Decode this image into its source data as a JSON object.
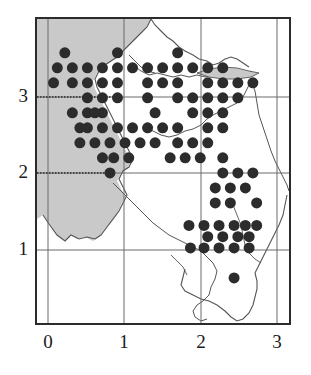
{
  "figure": {
    "kind": "distribution-grid-map",
    "width": 311,
    "height": 375
  },
  "colors": {
    "background": "#ffffff",
    "frame": "#2b2b2b",
    "gridline": "#6a6a6a",
    "dot": "#2c2c2c",
    "sea_shading": "#c9c9c9",
    "coastline": "#555555",
    "label": "#1a1a1a"
  },
  "axes": {
    "x": {
      "ticks": [
        {
          "label": "0",
          "value": 0,
          "px": 48
        },
        {
          "label": "1",
          "value": 1,
          "px": 124
        },
        {
          "label": "2",
          "value": 2,
          "px": 201
        },
        {
          "label": "3",
          "value": 3,
          "px": 277
        }
      ],
      "range": [
        -0.17,
        3.18
      ]
    },
    "y": {
      "ticks": [
        {
          "label": "1",
          "value": 1,
          "px": 249
        },
        {
          "label": "2",
          "value": 2,
          "px": 172
        },
        {
          "label": "3",
          "value": 3,
          "px": 96
        }
      ],
      "range": [
        0.0,
        4.05
      ]
    },
    "grid_spacing_px": 76,
    "dotted_gridlines": [
      "y=3 left of x=1",
      "y=2 left of x=0.8"
    ]
  },
  "chart_data": {
    "type": "scatter",
    "title": "",
    "xlabel": "",
    "ylabel": "",
    "xlim": [
      -0.17,
      3.18
    ],
    "ylim": [
      0.0,
      4.05
    ],
    "grid": true,
    "legend": null,
    "marker": "filled-circle",
    "marker_size_px": 11,
    "cell_size": 0.2,
    "points": [
      [
        0.2,
        3.6
      ],
      [
        0.9,
        3.6
      ],
      [
        1.7,
        3.6
      ],
      [
        0.1,
        3.4
      ],
      [
        0.3,
        3.4
      ],
      [
        0.5,
        3.4
      ],
      [
        0.7,
        3.4
      ],
      [
        0.9,
        3.4
      ],
      [
        1.1,
        3.4
      ],
      [
        1.3,
        3.4
      ],
      [
        1.5,
        3.4
      ],
      [
        1.7,
        3.4
      ],
      [
        1.9,
        3.4
      ],
      [
        2.1,
        3.4
      ],
      [
        2.3,
        3.4
      ],
      [
        0.05,
        3.2
      ],
      [
        0.3,
        3.2
      ],
      [
        0.5,
        3.2
      ],
      [
        0.7,
        3.2
      ],
      [
        0.9,
        3.2
      ],
      [
        1.3,
        3.2
      ],
      [
        1.5,
        3.2
      ],
      [
        1.7,
        3.2
      ],
      [
        2.1,
        3.2
      ],
      [
        2.3,
        3.2
      ],
      [
        2.5,
        3.2
      ],
      [
        2.7,
        3.2
      ],
      [
        0.5,
        3.0
      ],
      [
        0.7,
        3.0
      ],
      [
        0.9,
        3.0
      ],
      [
        1.3,
        3.0
      ],
      [
        1.7,
        3.0
      ],
      [
        1.9,
        3.0
      ],
      [
        2.1,
        3.0
      ],
      [
        2.3,
        3.0
      ],
      [
        2.5,
        3.0
      ],
      [
        0.3,
        2.8
      ],
      [
        0.5,
        2.8
      ],
      [
        0.7,
        2.8
      ],
      [
        1.4,
        2.8
      ],
      [
        1.9,
        2.8
      ],
      [
        2.1,
        2.8
      ],
      [
        2.3,
        2.8
      ],
      [
        0.4,
        2.6
      ],
      [
        0.6,
        2.8
      ],
      [
        0.5,
        2.6
      ],
      [
        0.7,
        2.6
      ],
      [
        0.9,
        2.6
      ],
      [
        1.1,
        2.6
      ],
      [
        1.3,
        2.6
      ],
      [
        1.5,
        2.6
      ],
      [
        1.7,
        2.6
      ],
      [
        2.1,
        2.6
      ],
      [
        2.3,
        2.6
      ],
      [
        0.4,
        2.4
      ],
      [
        0.6,
        2.4
      ],
      [
        0.8,
        2.4
      ],
      [
        1.0,
        2.4
      ],
      [
        1.2,
        2.4
      ],
      [
        1.4,
        2.4
      ],
      [
        1.7,
        2.4
      ],
      [
        1.9,
        2.4
      ],
      [
        2.1,
        2.4
      ],
      [
        0.7,
        2.2
      ],
      [
        0.85,
        2.2
      ],
      [
        1.05,
        2.2
      ],
      [
        1.6,
        2.2
      ],
      [
        1.8,
        2.2
      ],
      [
        2.0,
        2.2
      ],
      [
        2.3,
        2.2
      ],
      [
        0.8,
        2.0
      ],
      [
        2.3,
        2.0
      ],
      [
        2.5,
        2.0
      ],
      [
        2.7,
        2.0
      ],
      [
        2.2,
        1.8
      ],
      [
        2.4,
        1.8
      ],
      [
        2.6,
        1.8
      ],
      [
        2.2,
        1.6
      ],
      [
        2.4,
        1.6
      ],
      [
        2.75,
        1.6
      ],
      [
        1.85,
        1.3
      ],
      [
        2.05,
        1.3
      ],
      [
        2.25,
        1.3
      ],
      [
        2.45,
        1.3
      ],
      [
        2.6,
        1.3
      ],
      [
        2.75,
        1.3
      ],
      [
        2.1,
        1.15
      ],
      [
        2.3,
        1.15
      ],
      [
        2.5,
        1.15
      ],
      [
        2.65,
        1.15
      ],
      [
        1.87,
        1.0
      ],
      [
        2.05,
        1.0
      ],
      [
        2.25,
        1.0
      ],
      [
        2.45,
        1.0
      ],
      [
        2.65,
        1.0
      ],
      [
        2.45,
        0.6
      ]
    ]
  },
  "labels": {
    "x_axis": [
      "0",
      "1",
      "2",
      "3"
    ],
    "y_axis": [
      "3",
      "2",
      "1"
    ]
  }
}
